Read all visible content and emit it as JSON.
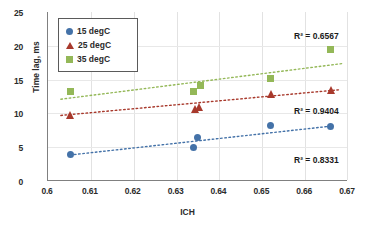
{
  "chart_data": {
    "type": "scatter",
    "title": "",
    "xlabel": "ICH",
    "ylabel": "Time lag, ms",
    "xlim": [
      0.6,
      0.67
    ],
    "ylim": [
      0,
      25
    ],
    "xticks": [
      "0.6",
      "0.61",
      "0.62",
      "0.63",
      "0.64",
      "0.65",
      "0.66",
      "0.67"
    ],
    "yticks": [
      "0",
      "5",
      "10",
      "15",
      "20",
      "25"
    ],
    "grid": "vertical-and-horizontal-light",
    "legend_position": "top-left-inside",
    "series": [
      {
        "name": "15 degC",
        "marker": "circle",
        "color": "#4472a8",
        "points": [
          {
            "x": 0.6052,
            "y": 3.9
          },
          {
            "x": 0.634,
            "y": 4.9
          },
          {
            "x": 0.6348,
            "y": 6.5
          },
          {
            "x": 0.652,
            "y": 8.2
          },
          {
            "x": 0.666,
            "y": 8.1
          }
        ],
        "trend": {
          "x1": 0.6052,
          "y1": 3.85,
          "x2": 0.6665,
          "y2": 8.15
        },
        "r2_label": "R² = 0.8331",
        "r2_value": 0.8331
      },
      {
        "name": "25 degC",
        "marker": "triangle",
        "color": "#a8392c",
        "points": [
          {
            "x": 0.6052,
            "y": 9.7
          },
          {
            "x": 0.6342,
            "y": 10.7
          },
          {
            "x": 0.6352,
            "y": 10.9
          },
          {
            "x": 0.652,
            "y": 12.8
          },
          {
            "x": 0.666,
            "y": 13.4
          }
        ],
        "trend": {
          "x1": 0.603,
          "y1": 9.7,
          "x2": 0.668,
          "y2": 13.5
        },
        "r2_label": "R² = 0.9404",
        "r2_value": 0.9404
      },
      {
        "name": "35 degC",
        "marker": "square",
        "color": "#94b858",
        "points": [
          {
            "x": 0.6052,
            "y": 13.3
          },
          {
            "x": 0.634,
            "y": 13.3
          },
          {
            "x": 0.6356,
            "y": 14.2
          },
          {
            "x": 0.652,
            "y": 15.1
          },
          {
            "x": 0.666,
            "y": 19.4
          }
        ],
        "trend": {
          "x1": 0.603,
          "y1": 12.1,
          "x2": 0.669,
          "y2": 17.4
        },
        "r2_label": "R² = 0.6567",
        "r2_value": 0.6567
      }
    ],
    "annotations": [
      {
        "text": "R² = 0.6567",
        "series": "35 degC",
        "left": 294,
        "top": 31
      },
      {
        "text": "R² = 0.9404",
        "series": "25 degC",
        "left": 294,
        "top": 106
      },
      {
        "text": "R² = 0.8331",
        "series": "15 degC",
        "left": 294,
        "top": 155
      }
    ]
  },
  "legend": {
    "items": [
      {
        "label": "15 degC",
        "color": "#4472a8",
        "marker": "circle"
      },
      {
        "label": "25 degC",
        "color": "#a8392c",
        "marker": "triangle"
      },
      {
        "label": "35 degC",
        "color": "#94b858",
        "marker": "square"
      }
    ]
  }
}
